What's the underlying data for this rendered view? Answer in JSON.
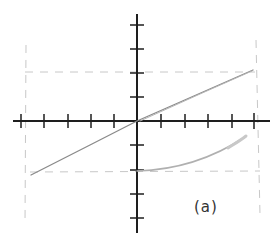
{
  "figure": {
    "label": "(a)",
    "colors": {
      "axes": "#1e1e1e",
      "line": "#8a8a8a",
      "curve": "#b0b0b0",
      "dashed": "#c8c8c8"
    },
    "axes": {
      "x_ticks_left": 5,
      "x_ticks_right": 5,
      "y_ticks_up": 4,
      "y_ticks_down": 4
    },
    "dashed_guides": {
      "horizontal_upper_y": 2,
      "horizontal_lower_y": -2,
      "vertical_left_x": -4.8,
      "vertical_right_x": 5
    },
    "line": {
      "from": [
        -4.5,
        -2.2
      ],
      "to": [
        5,
        2.1
      ]
    },
    "curve": {
      "from": [
        0,
        -2
      ],
      "to": [
        4.6,
        -0.7
      ]
    }
  }
}
